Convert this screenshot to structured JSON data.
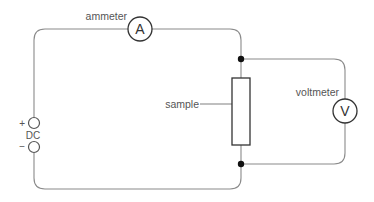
{
  "diagram": {
    "type": "circuit",
    "components": {
      "ammeter": {
        "label": "ammeter",
        "symbol": "A"
      },
      "voltmeter": {
        "label": "voltmeter",
        "symbol": "V"
      },
      "sample": {
        "label": "sample"
      },
      "dc_source": {
        "label": "DC",
        "positive": "+",
        "negative": "−"
      }
    },
    "colors": {
      "wire": "#8a8a8a",
      "component_stroke": "#333333",
      "junction": "#111111",
      "text": "#555555"
    }
  }
}
